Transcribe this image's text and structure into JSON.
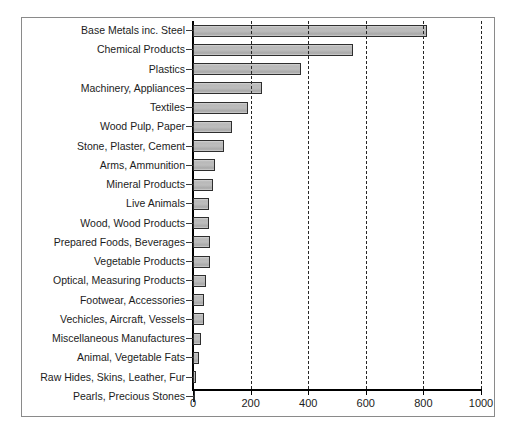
{
  "chart_data": {
    "type": "bar",
    "orientation": "horizontal",
    "title": "",
    "xlabel": "",
    "ylabel": "",
    "xlim": [
      0,
      1000
    ],
    "xticks": [
      0,
      200,
      400,
      600,
      800,
      1000
    ],
    "grid": "vertical-dashed",
    "legend": "none",
    "bar_fill_color": "#bdbdbd",
    "bar_border_color": "#2e2e2e",
    "axis_color": "#000000",
    "categories": [
      "Base Metals inc. Steel",
      "Chemical Products",
      "Plastics",
      "Machinery, Appliances",
      "Textiles",
      "Wood Pulp, Paper",
      "Stone, Plaster, Cement",
      "Arms, Ammunition",
      "Mineral Products",
      "Live Animals",
      "Wood, Wood Products",
      "Prepared Foods, Beverages",
      "Vegetable Products",
      "Optical, Measuring Products",
      "Footwear, Accessories",
      "Vechicles, Aircraft, Vessels",
      "Miscellaneous Manufactures",
      "Animal, Vegetable Fats",
      "Raw Hides, Skins, Leather, Fur",
      "Pearls, Precious Stones"
    ],
    "values": [
      812,
      555,
      375,
      240,
      191,
      135,
      107,
      76,
      70,
      55,
      55,
      59,
      59,
      45,
      38,
      38,
      28,
      21,
      10,
      2
    ]
  }
}
